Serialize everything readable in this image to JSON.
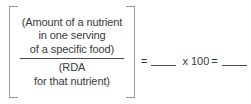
{
  "figure": {
    "name": "percent-rda-formula",
    "colors": {
      "text": "#3a3a3a",
      "rule": "#4a4a4a",
      "bracket": "#9a9a9a",
      "background": "#ffffff"
    }
  },
  "formula": {
    "numerator": {
      "lines": [
        "(Amount of a nutrient",
        "in one serving",
        "of a specific food)"
      ]
    },
    "denominator": {
      "lines": [
        "(RDA",
        "for that nutrient)"
      ]
    },
    "right_side": {
      "equals_first": "=",
      "blank_quotient": "",
      "times": "x",
      "multiplier": "100",
      "equals_second": "=",
      "blank_result": "",
      "percent": "%"
    }
  }
}
